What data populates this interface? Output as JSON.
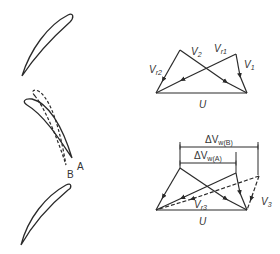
{
  "figure": {
    "blades": {
      "top": {
        "label": ""
      },
      "middle": {
        "label_solid": "A",
        "label_dashed": "B"
      },
      "bottom": {
        "label": ""
      }
    },
    "triangle_inlet_outlet": {
      "labels": {
        "v_r2": "V",
        "v_r2_sub": "r2",
        "v_2": "V",
        "v_2_sub": "2",
        "v_r1": "V",
        "v_r1_sub": "r1",
        "v_1": "V",
        "v_1_sub": "1",
        "u": "U"
      }
    },
    "triangle_comparison": {
      "labels": {
        "dvw_b": "ΔV",
        "dvw_b_sub": "w(B)",
        "dvw_a": "ΔV",
        "dvw_a_sub": "w(A)",
        "v_r3": "V",
        "v_r3_sub": "r3",
        "v_3": "V",
        "v_3_sub": "3",
        "u": "U"
      }
    },
    "colors": {
      "line": "#2a2a2a",
      "text": "#333333",
      "background": "#ffffff"
    }
  }
}
